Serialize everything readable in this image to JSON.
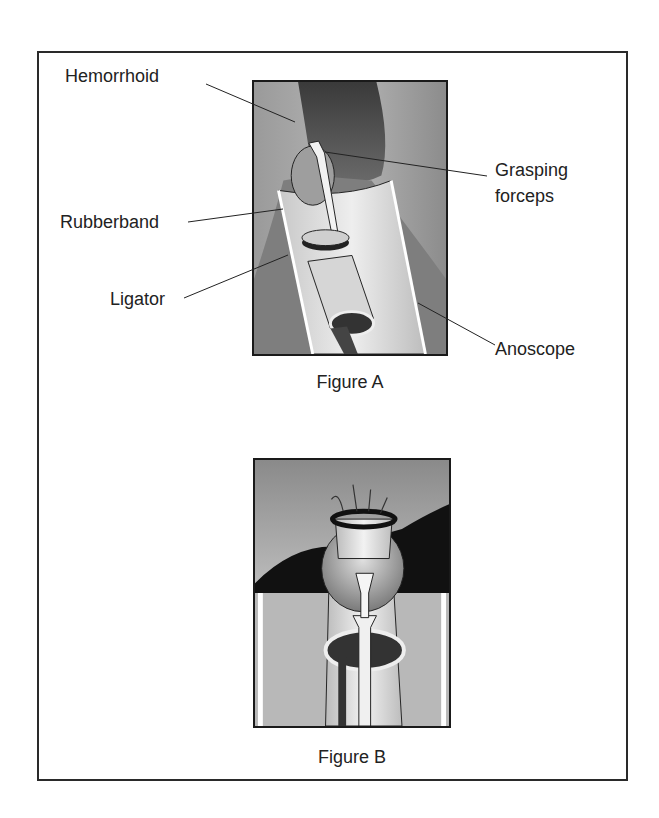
{
  "figure_a": {
    "caption": "Figure A",
    "labels": {
      "hemorrhoid": "Hemorrhoid",
      "grasping_forceps_line1": "Grasping",
      "grasping_forceps_line2": "forceps",
      "rubberband": "Rubberband",
      "ligator": "Ligator",
      "anoscope": "Anoscope"
    }
  },
  "figure_b": {
    "caption": "Figure B"
  },
  "colors": {
    "border": "#1a1a1a",
    "tissue": "#8a8a8a",
    "dark_tissue": "#333333",
    "instrument": "#d9d9d9",
    "background": "#ffffff"
  }
}
